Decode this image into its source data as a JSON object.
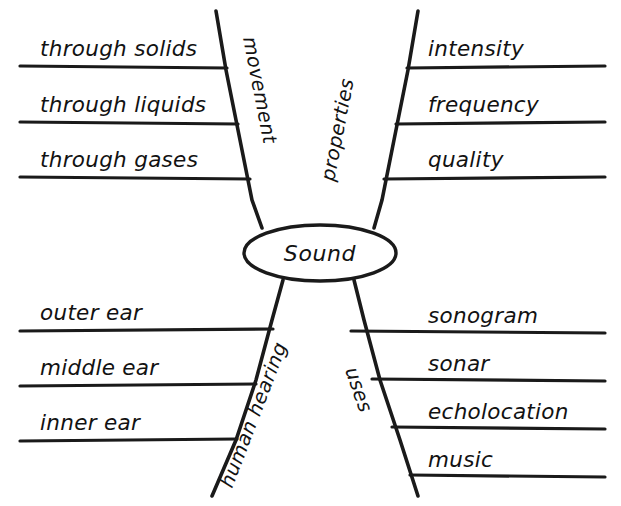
{
  "diagram": {
    "type": "concept-map",
    "title": "Sound",
    "center": {
      "label": "Sound",
      "shape": "ellipse",
      "cx": 320,
      "cy": 253,
      "rx": 76,
      "ry": 28
    },
    "background_color": "#ffffff",
    "ink_color": "#1a1a1a",
    "branches": [
      {
        "id": "movement",
        "label": "movement",
        "position": "top-left",
        "label_rotation": -62,
        "leaves": [
          {
            "label": "through solids",
            "line_y": 66,
            "text_x": 40,
            "text_y": 56
          },
          {
            "label": "through liquids",
            "line_y": 122,
            "text_x": 40,
            "text_y": 112
          },
          {
            "label": "through gases",
            "line_y": 177,
            "text_x": 40,
            "text_y": 167
          }
        ]
      },
      {
        "id": "properties",
        "label": "properties",
        "position": "top-right",
        "label_rotation": 62,
        "leaves": [
          {
            "label": "intensity",
            "line_y": 66,
            "text_x": 428,
            "text_y": 56
          },
          {
            "label": "frequency",
            "line_y": 122,
            "text_x": 428,
            "text_y": 112
          },
          {
            "label": "quality",
            "line_y": 177,
            "text_x": 428,
            "text_y": 167
          }
        ]
      },
      {
        "id": "human-hearing",
        "label": "human hearing",
        "position": "bottom-left",
        "label_rotation": 62,
        "leaves": [
          {
            "label": "outer ear",
            "line_y": 330,
            "text_x": 40,
            "text_y": 320
          },
          {
            "label": "middle ear",
            "line_y": 385,
            "text_x": 40,
            "text_y": 375
          },
          {
            "label": "inner ear",
            "line_y": 440,
            "text_x": 40,
            "text_y": 430
          }
        ]
      },
      {
        "id": "uses",
        "label": "uses",
        "position": "bottom-right",
        "label_rotation": -62,
        "leaves": [
          {
            "label": "sonogram",
            "line_y": 333,
            "text_x": 428,
            "text_y": 323
          },
          {
            "label": "sonar",
            "line_y": 381,
            "text_x": 428,
            "text_y": 371
          },
          {
            "label": "echolocation",
            "line_y": 429,
            "text_x": 428,
            "text_y": 419
          },
          {
            "label": "music",
            "line_y": 477,
            "text_x": 428,
            "text_y": 467
          }
        ]
      }
    ]
  }
}
